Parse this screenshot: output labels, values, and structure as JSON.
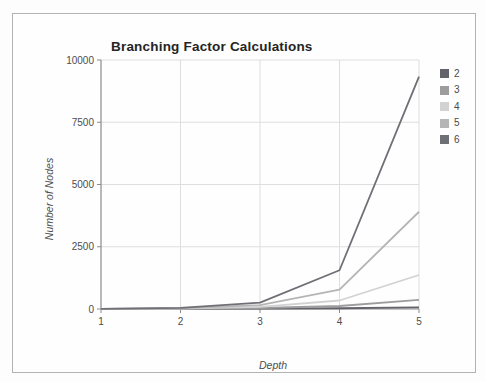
{
  "page": {
    "kind": "scanned chart figure"
  },
  "chart_data": {
    "type": "line",
    "title": "Branching Factor Calculations",
    "xlabel": "Depth",
    "ylabel": "Number of Nodes",
    "x": [
      1,
      2,
      3,
      4,
      5
    ],
    "x_tick_labels": [
      "1",
      "2",
      "3",
      "4",
      "5"
    ],
    "y_ticks": [
      0,
      2500,
      5000,
      7500,
      10000
    ],
    "y_tick_labels": [
      "0",
      "2500",
      "5000",
      "7500",
      "10000"
    ],
    "xlim": [
      1,
      5
    ],
    "ylim": [
      0,
      10000
    ],
    "grid": true,
    "legend_position": "right",
    "series": [
      {
        "name": "2",
        "color": "#63636b",
        "values": [
          3,
          7,
          15,
          31,
          63
        ]
      },
      {
        "name": "3",
        "color": "#9d9d9d",
        "values": [
          4,
          13,
          40,
          121,
          364
        ]
      },
      {
        "name": "4",
        "color": "#d2d2d2",
        "values": [
          5,
          21,
          85,
          341,
          1365
        ]
      },
      {
        "name": "5",
        "color": "#b5b5b5",
        "values": [
          6,
          31,
          156,
          781,
          3906
        ]
      },
      {
        "name": "6",
        "color": "#6f6f76",
        "values": [
          7,
          43,
          259,
          1555,
          9331
        ]
      }
    ],
    "colors": {
      "axis": "#8a8a8a",
      "gridline": "#dedede",
      "tick_text": "#4d4d4d"
    }
  }
}
